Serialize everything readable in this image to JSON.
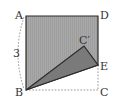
{
  "diagram": {
    "type": "geometry-fold",
    "labels": {
      "A": "A",
      "B": "B",
      "C": "C",
      "D": "D",
      "E": "E",
      "C_prime": "C′",
      "side_length": "3"
    },
    "points": {
      "A": [
        26,
        16
      ],
      "B": [
        26,
        90
      ],
      "C": [
        98,
        90
      ],
      "D": [
        98,
        16
      ],
      "E": [
        98,
        65
      ],
      "C_prime": [
        84,
        46
      ]
    },
    "colors": {
      "square_fill": "#a8a8a8",
      "folded_triangle_fill": "#7a7a7a",
      "outline": "#2a2a2a",
      "dashed": "#888888",
      "label": "#333333"
    }
  }
}
